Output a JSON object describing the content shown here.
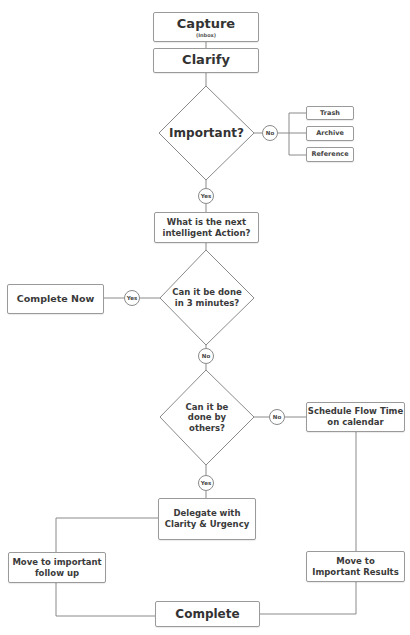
{
  "diagram": {
    "colors": {
      "line": "#8a8a8a",
      "box_border": "#9a9a9a",
      "text": "#333333",
      "background": "#ffffff"
    },
    "nodes": {
      "capture": {
        "label": "Capture",
        "sublabel": "(Inbox)"
      },
      "clarify": {
        "label": "Clarify"
      },
      "important": {
        "label": "Important?"
      },
      "important_no": {
        "label": "No"
      },
      "trash": {
        "label": "Trash"
      },
      "archive": {
        "label": "Archive"
      },
      "reference": {
        "label": "Reference"
      },
      "important_yes": {
        "label": "Yes"
      },
      "next_action": {
        "line1": "What is the next",
        "line2": "intelligent Action?"
      },
      "three_minutes": {
        "line1": "Can it be done",
        "line2": "in 3 minutes?"
      },
      "three_minutes_yes": {
        "label": "Yes"
      },
      "complete_now": {
        "label": "Complete Now"
      },
      "three_minutes_no": {
        "label": "No"
      },
      "by_others": {
        "line1": "Can it be",
        "line2": "done by",
        "line3": "others?"
      },
      "by_others_no": {
        "label": "No"
      },
      "schedule": {
        "line1": "Schedule Flow Time",
        "line2": "on calendar"
      },
      "by_others_yes": {
        "label": "Yes"
      },
      "delegate": {
        "line1": "Delegate with",
        "line2": "Clarity & Urgency"
      },
      "follow_up": {
        "line1": "Move to important",
        "line2": "follow up"
      },
      "important_results": {
        "line1": "Move to",
        "line2": "Important Results"
      },
      "complete": {
        "label": "Complete"
      }
    }
  }
}
